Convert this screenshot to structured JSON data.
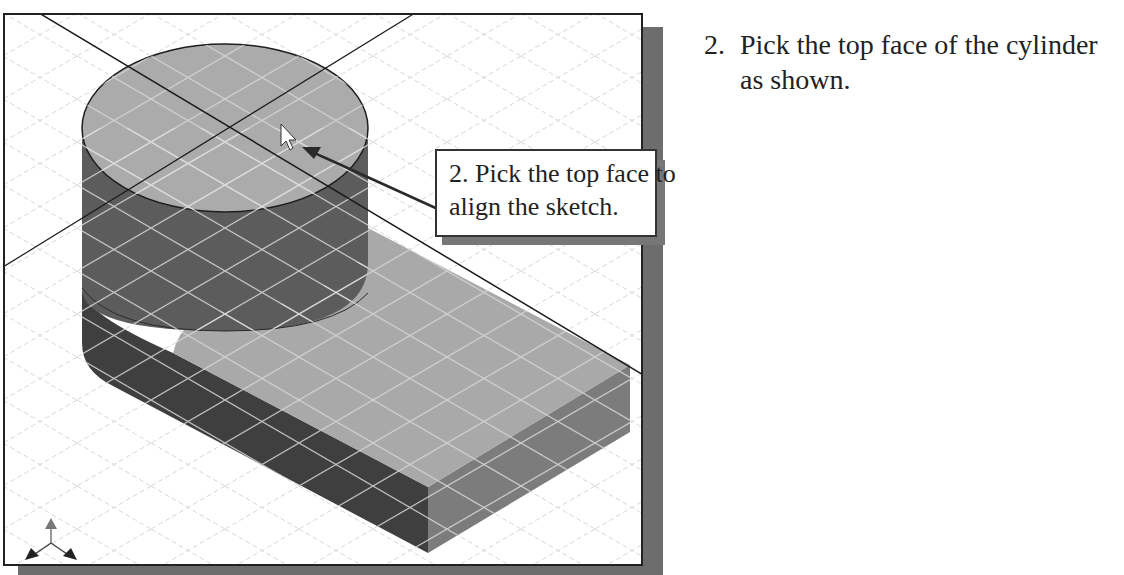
{
  "instruction": {
    "number": "2.",
    "lines": [
      "Pick the top face of the cylinder",
      "as shown."
    ]
  },
  "callout": {
    "lines": [
      "2. Pick the top face to",
      "align the sketch."
    ]
  },
  "viewport": {
    "model": "cylinder-on-rounded-block",
    "grid": "isometric",
    "triad": "view-orientation-triad"
  },
  "colors": {
    "frame_shadow": "#6d6d6d",
    "cylinder_top": "#a9a9a9",
    "cylinder_side": "#5a5a5a",
    "block_top": "#a8a8a8",
    "block_front": "#3e3e3e",
    "block_side": "#7b7b7b"
  }
}
